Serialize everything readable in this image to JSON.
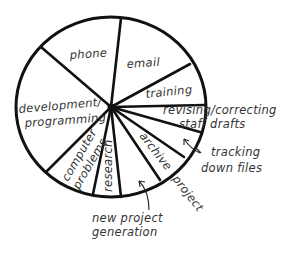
{
  "chart_data": {
    "type": "pie",
    "title": "",
    "style": "hand-drawn, black outline, no fill, no values shown",
    "start_angle_deg": 6,
    "direction": "clockwise",
    "categories": [
      "email",
      "training",
      "revising/correcting staff drafts",
      "tracking down files",
      "archive project",
      "new project generation",
      "research",
      "computer problems",
      "development/programming",
      "phone"
    ],
    "values": [
      15,
      8,
      4,
      5,
      6,
      8,
      5,
      9,
      24,
      16
    ],
    "unit": "percent of time (estimated from slice angles)",
    "legend": "none (labels placed on/near slices)"
  },
  "labels": {
    "phone": "phone",
    "email": "email",
    "training": "training",
    "revising_line1": "revising/correcting",
    "revising_line2": "staff drafts",
    "tracking_line1": "tracking",
    "tracking_line2": "down files",
    "archive": "archive",
    "archive_project": "project",
    "new_project_line1": "new project",
    "new_project_line2": "generation",
    "research": "research",
    "computer_line1": "computer",
    "computer_line2": "problems",
    "development_line1": "development/",
    "development_line2": "programming"
  },
  "geometry": {
    "center": [
      111,
      107
    ],
    "rx": 95,
    "ry": 90,
    "boundary_points": [
      [
        121,
        18
      ],
      [
        190,
        64
      ],
      [
        205,
        105
      ],
      [
        200,
        132
      ],
      [
        184,
        157
      ],
      [
        160,
        180
      ],
      [
        121,
        197
      ],
      [
        93,
        194
      ],
      [
        46,
        172
      ],
      [
        41,
        47
      ]
    ]
  }
}
